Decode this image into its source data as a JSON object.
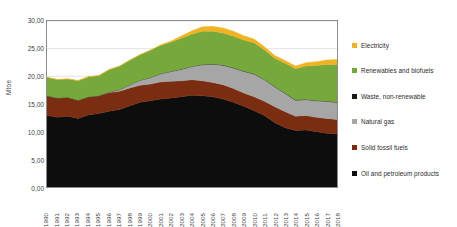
{
  "chart_data": {
    "type": "area",
    "stacked": true,
    "title": "",
    "xlabel": "",
    "ylabel": "Mtoe",
    "ylim": [
      0,
      30
    ],
    "ytick_step": 5,
    "ytick_labels": [
      "30,00",
      "25,00",
      "20,00",
      "15,00",
      "10,00",
      "5,00",
      "0,00"
    ],
    "ytick_values": [
      30,
      25,
      20,
      15,
      10,
      5,
      0
    ],
    "grid": true,
    "grid_axis": "y",
    "legend_position": "right",
    "decimal_separator": ",",
    "categories": [
      "1990",
      "1991",
      "1992",
      "1993",
      "1994",
      "1995",
      "1996",
      "1997",
      "1998",
      "1999",
      "2000",
      "2001",
      "2002",
      "2003",
      "2004",
      "2005",
      "2006",
      "2007",
      "2008",
      "2009",
      "2010",
      "2011",
      "2012",
      "2013",
      "2014",
      "2015",
      "2016",
      "2017",
      "2018"
    ],
    "series": [
      {
        "name": "Oil and petroleum products",
        "color": "#0d0d0d",
        "values": [
          12.9,
          12.6,
          12.8,
          12.4,
          13.0,
          13.3,
          13.7,
          14.0,
          14.7,
          15.3,
          15.6,
          15.9,
          16.1,
          16.3,
          16.6,
          16.5,
          16.3,
          15.9,
          15.3,
          14.6,
          13.8,
          12.9,
          11.6,
          10.7,
          10.2,
          10.3,
          10.0,
          9.7,
          9.6
        ]
      },
      {
        "name": "Solid fossil fuels",
        "color": "#7b2d12",
        "values": [
          3.6,
          3.5,
          3.4,
          3.3,
          3.3,
          3.2,
          3.4,
          3.3,
          3.2,
          3.1,
          3.0,
          3.1,
          3.0,
          2.9,
          2.8,
          2.7,
          2.6,
          2.6,
          2.5,
          2.4,
          2.5,
          2.6,
          2.9,
          2.9,
          2.6,
          2.6,
          2.6,
          2.7,
          2.6
        ]
      },
      {
        "name": "Natural gas",
        "color": "#a6a6a6",
        "values": [
          0.0,
          0.0,
          0.0,
          0.0,
          0.0,
          0.0,
          0.1,
          0.3,
          0.6,
          0.9,
          1.2,
          1.5,
          1.8,
          2.1,
          2.4,
          2.9,
          3.3,
          3.5,
          3.7,
          3.9,
          4.1,
          3.9,
          3.6,
          3.3,
          2.9,
          2.9,
          3.0,
          3.1,
          3.1
        ]
      },
      {
        "name": "Waste, non-renewable",
        "color": "#1a1a1a",
        "values": [
          0.0,
          0.0,
          0.0,
          0.0,
          0.0,
          0.0,
          0.0,
          0.0,
          0.0,
          0.0,
          0.0,
          0.0,
          0.0,
          0.02,
          0.03,
          0.04,
          0.05,
          0.05,
          0.05,
          0.05,
          0.05,
          0.05,
          0.05,
          0.05,
          0.05,
          0.05,
          0.05,
          0.05,
          0.05
        ]
      },
      {
        "name": "Renewables and biofuels",
        "color": "#76a83c",
        "values": [
          3.3,
          3.3,
          3.3,
          3.5,
          3.6,
          3.6,
          4.0,
          4.2,
          4.4,
          4.6,
          4.9,
          5.1,
          5.3,
          5.6,
          5.8,
          6.0,
          5.9,
          5.8,
          5.7,
          5.6,
          5.6,
          5.3,
          5.1,
          5.4,
          5.6,
          6.0,
          6.3,
          6.6,
          6.8
        ]
      },
      {
        "name": "Electricity",
        "color": "#f0b323",
        "values": [
          0.05,
          0.05,
          0.05,
          0.05,
          0.05,
          0.05,
          0.05,
          0.05,
          0.05,
          0.05,
          0.05,
          0.1,
          0.2,
          0.4,
          0.6,
          0.8,
          0.9,
          0.9,
          0.9,
          0.8,
          0.7,
          0.6,
          0.5,
          0.5,
          0.5,
          0.6,
          0.7,
          0.8,
          0.9
        ]
      }
    ]
  },
  "legend": {
    "items": [
      {
        "label": "Electricity",
        "color": "#f0b323"
      },
      {
        "label": "Renewables and biofuels",
        "color": "#76a83c"
      },
      {
        "label": "Waste, non-renewable",
        "color": "#1a1a1a"
      },
      {
        "label": "Natural gas",
        "color": "#a6a6a6"
      },
      {
        "label": "Solid fossil fuels",
        "color": "#7b2d12"
      },
      {
        "label": "Oil and petroleum products",
        "color": "#0d0d0d"
      }
    ]
  }
}
